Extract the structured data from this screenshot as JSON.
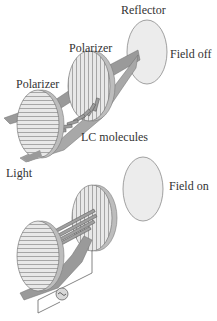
{
  "labels": {
    "reflector": "Reflector",
    "polarizer_rear": "Polarizer",
    "polarizer_front": "Polarizer",
    "field_off": "Field off",
    "lc_molecules": "LC molecules",
    "light": "Light",
    "field_on": "Field on"
  },
  "colors": {
    "reflector_fill": "#ececec",
    "polarizer_fill": "#e6e6e6",
    "polarizer_line": "#8a8a8a",
    "light_beam": "#9a9a9a",
    "outline": "#7a7a7a",
    "text": "#333333"
  },
  "icons": {
    "ac_source": "sine-wave-in-circle"
  }
}
